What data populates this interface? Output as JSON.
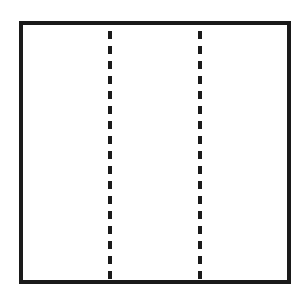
{
  "diagram": {
    "shape": "square",
    "border_color": "#1a1a1a",
    "background": "#ffffff",
    "fold_lines": [
      {
        "orientation": "vertical",
        "style": "dashed",
        "x_fraction": 0.333
      },
      {
        "orientation": "vertical",
        "style": "dashed",
        "x_fraction": 0.667
      }
    ]
  }
}
